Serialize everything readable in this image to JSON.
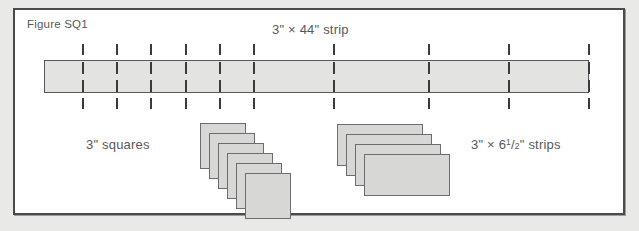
{
  "figure": {
    "caption": "Figure SQ1",
    "background_color": "#e9e9e7",
    "page_color": "#ffffff",
    "frame_color": "#4b4b4d",
    "piece_fill": "#d7d7d5",
    "strip_fill": "#e3e3e1",
    "outline_color": "#58585a",
    "text_color": "#58585a"
  },
  "labels": {
    "long_strip": "3\" × 44\" strip",
    "squares": "3\" squares",
    "short_strips_prefix": "3\" × 6",
    "short_strips_numerator": "1",
    "short_strips_slash": "/",
    "short_strips_denominator": "2",
    "short_strips_suffix": "\" strips"
  },
  "long_strip": {
    "label": "3\" × 44\" strip",
    "width_inches": 44,
    "height_inches": 3,
    "cut_mark_count": 10,
    "cut_mark_x": [
      82,
      116,
      150,
      185,
      219,
      253,
      333,
      428,
      508,
      588
    ]
  },
  "stacks": [
    {
      "name": "squares-stack",
      "label": "3\" squares",
      "piece_shape": "square",
      "piece_count": 6,
      "piece_width_inches": 3,
      "piece_height_inches": 3,
      "origin_x": 200,
      "origin_y": 123,
      "offset_x": 9,
      "offset_y": 10
    },
    {
      "name": "strips-stack",
      "label": "3\" × 6 1/2\" strips",
      "piece_shape": "rectangle",
      "piece_count": 4,
      "piece_width_inches": 6.5,
      "piece_height_inches": 3,
      "origin_x": 337,
      "origin_y": 124,
      "offset_x": 9,
      "offset_y": 10
    }
  ]
}
